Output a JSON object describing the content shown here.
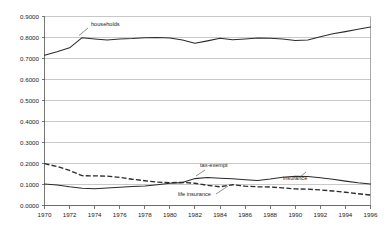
{
  "chart_data": {
    "type": "line",
    "title": "",
    "subtitle": "",
    "xlabel": "",
    "ylabel": "",
    "xlim": [
      1970,
      1996
    ],
    "ylim": [
      0.0,
      0.9
    ],
    "grid": true,
    "legend_position": "inline-annotations",
    "x": [
      1970,
      1971,
      1972,
      1973,
      1974,
      1975,
      1976,
      1977,
      1978,
      1979,
      1980,
      1981,
      1982,
      1983,
      1984,
      1985,
      1986,
      1987,
      1988,
      1989,
      1990,
      1991,
      1992,
      1993,
      1994,
      1995,
      1996
    ],
    "xticks": [
      1970,
      1972,
      1974,
      1976,
      1978,
      1980,
      1982,
      1984,
      1986,
      1988,
      1990,
      1992,
      1994,
      1996
    ],
    "xtick_labels": [
      "1970",
      "1972",
      "1974",
      "1976",
      "1978",
      "1980",
      "1982",
      "1984",
      "1986",
      "1988",
      "1990",
      "1992",
      "1994",
      "1996"
    ],
    "yticks": [
      0.0,
      0.1,
      0.2,
      0.3,
      0.4,
      0.5,
      0.6,
      0.7,
      0.8,
      0.9
    ],
    "ytick_labels": [
      "0.0000",
      "0.1000",
      "0.2000",
      "0.3000",
      "0.4000",
      "0.5000",
      "0.6000",
      "0.7000",
      "0.8000",
      "0.9000"
    ],
    "series": [
      {
        "name": "households",
        "label": "households",
        "style": "solid",
        "color": "#2b2b2b",
        "values": [
          0.715,
          0.732,
          0.751,
          0.799,
          0.793,
          0.788,
          0.793,
          0.795,
          0.799,
          0.8,
          0.798,
          0.788,
          0.773,
          0.784,
          0.796,
          0.789,
          0.793,
          0.798,
          0.796,
          0.793,
          0.786,
          0.788,
          0.804,
          0.818,
          0.828,
          0.839,
          0.85
        ]
      },
      {
        "name": "tax-exempt-insurance",
        "label": "tax-exempt",
        "label2": "insurance",
        "style": "solid",
        "color": "#2b2b2b",
        "values": [
          0.102,
          0.098,
          0.089,
          0.082,
          0.08,
          0.083,
          0.087,
          0.09,
          0.093,
          0.099,
          0.106,
          0.109,
          0.128,
          0.133,
          0.13,
          0.127,
          0.123,
          0.119,
          0.126,
          0.135,
          0.139,
          0.138,
          0.132,
          0.125,
          0.116,
          0.108,
          0.102
        ]
      },
      {
        "name": "life-insurance",
        "label": "life insurance",
        "style": "dashed",
        "color": "#2b2b2b",
        "values": [
          0.199,
          0.186,
          0.167,
          0.142,
          0.141,
          0.14,
          0.134,
          0.125,
          0.118,
          0.111,
          0.109,
          0.11,
          0.106,
          0.096,
          0.089,
          0.099,
          0.092,
          0.089,
          0.088,
          0.084,
          0.079,
          0.078,
          0.074,
          0.069,
          0.063,
          0.056,
          0.05
        ]
      }
    ],
    "annotations": [
      {
        "name": "households",
        "text": "households",
        "x_px": 91,
        "y_px": 26
      },
      {
        "name": "tax-exempt",
        "text": "tax-exempt",
        "x_px": 200,
        "y_px": 167
      },
      {
        "name": "insurance",
        "text": "insurance",
        "x_px": 283,
        "y_px": 180
      },
      {
        "name": "life-insurance",
        "text": "life insurance",
        "x_px": 178,
        "y_px": 196
      }
    ],
    "colors": {
      "line": "#2b2b2b",
      "grid": "#b0b0b0",
      "axis": "#555555",
      "text": "#1a1a1a",
      "background": "#ffffff"
    }
  }
}
